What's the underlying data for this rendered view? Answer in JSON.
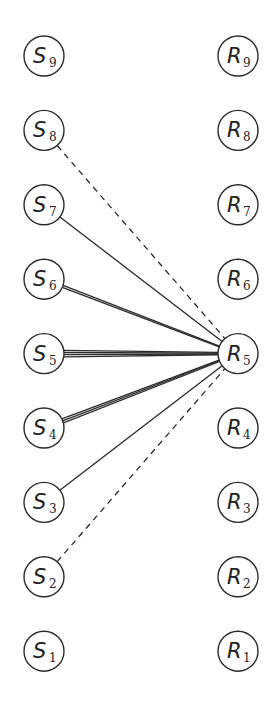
{
  "diagram": {
    "type": "bipartite-graph",
    "left_column": {
      "x": 44,
      "nodes": [
        {
          "letter": "S",
          "sub": "9",
          "id": "S9"
        },
        {
          "letter": "S",
          "sub": "8",
          "id": "S8"
        },
        {
          "letter": "S",
          "sub": "7",
          "id": "S7"
        },
        {
          "letter": "S",
          "sub": "6",
          "id": "S6"
        },
        {
          "letter": "S",
          "sub": "5",
          "id": "S5"
        },
        {
          "letter": "S",
          "sub": "4",
          "id": "S4"
        },
        {
          "letter": "S",
          "sub": "3",
          "id": "S3"
        },
        {
          "letter": "S",
          "sub": "2",
          "id": "S2"
        },
        {
          "letter": "S",
          "sub": "1",
          "id": "S1"
        }
      ]
    },
    "right_column": {
      "x": 238,
      "nodes": [
        {
          "letter": "R",
          "sub": "9",
          "id": "R9"
        },
        {
          "letter": "R",
          "sub": "8",
          "id": "R8"
        },
        {
          "letter": "R",
          "sub": "7",
          "id": "R7"
        },
        {
          "letter": "R",
          "sub": "6",
          "id": "R6"
        },
        {
          "letter": "R",
          "sub": "5",
          "id": "R5"
        },
        {
          "letter": "R",
          "sub": "4",
          "id": "R4"
        },
        {
          "letter": "R",
          "sub": "3",
          "id": "R3"
        },
        {
          "letter": "R",
          "sub": "2",
          "id": "R2"
        },
        {
          "letter": "R",
          "sub": "1",
          "id": "R1"
        }
      ]
    },
    "layout": {
      "top_y": 56,
      "spacing": 74.4,
      "radius": 20
    },
    "edges": [
      {
        "from": "S8",
        "to": "R5",
        "style": "dashed",
        "multiplicity": 1
      },
      {
        "from": "S7",
        "to": "R5",
        "style": "solid",
        "multiplicity": 1
      },
      {
        "from": "S6",
        "to": "R5",
        "style": "solid",
        "multiplicity": 2
      },
      {
        "from": "S5",
        "to": "R5",
        "style": "solid",
        "multiplicity": 4
      },
      {
        "from": "S4",
        "to": "R5",
        "style": "solid",
        "multiplicity": 3
      },
      {
        "from": "S3",
        "to": "R5",
        "style": "solid",
        "multiplicity": 1
      },
      {
        "from": "S2",
        "to": "R5",
        "style": "dashed",
        "multiplicity": 1
      }
    ],
    "colors": {
      "stroke": "#2a2a2a",
      "background": "#ffffff"
    }
  }
}
